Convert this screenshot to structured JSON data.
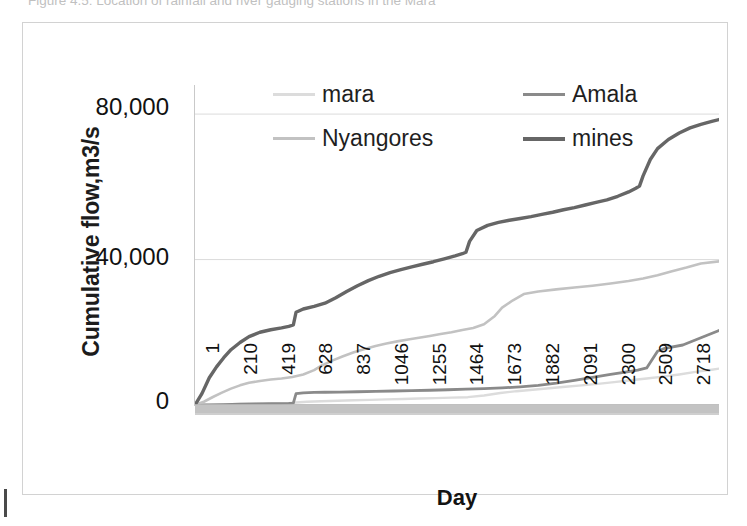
{
  "figure": {
    "caption": "Figure 4.5: Location of rainfall and river gauging stations in the Mara",
    "border_color": "#d2d2d2"
  },
  "chart_data": {
    "type": "line",
    "title": "",
    "xlabel": "Day",
    "ylabel": "Cumulative flow,m3/s",
    "xlim": [
      1,
      2900
    ],
    "ylim": [
      0,
      88000
    ],
    "ytick_labels": [
      "0",
      "40,000",
      "80,000"
    ],
    "ytick_values": [
      0,
      40000,
      80000
    ],
    "grid": "horizontal",
    "legend_position": "top-inside",
    "xtick_labels": [
      "1",
      "210",
      "419",
      "628",
      "837",
      "1046",
      "1255",
      "1464",
      "1673",
      "1882",
      "2091",
      "2300",
      "2509",
      "2718"
    ],
    "xtick_values": [
      1,
      210,
      419,
      628,
      837,
      1046,
      1255,
      1464,
      1673,
      1882,
      2091,
      2300,
      2509,
      2718
    ],
    "series": [
      {
        "name": "mara",
        "color": "#dcdcdc",
        "width": 2.4,
        "x": [
          1,
          80,
          160,
          250,
          340,
          430,
          520,
          560,
          620,
          700,
          790,
          880,
          970,
          1060,
          1150,
          1240,
          1330,
          1420,
          1510,
          1600,
          1690,
          1780,
          1870,
          1960,
          2050,
          2140,
          2230,
          2320,
          2410,
          2500,
          2590,
          2680,
          2770,
          2860,
          2900
        ],
        "y": [
          0,
          80,
          170,
          260,
          350,
          440,
          520,
          700,
          900,
          1050,
          1180,
          1300,
          1420,
          1540,
          1660,
          1780,
          1900,
          2020,
          2150,
          2600,
          3300,
          3800,
          4200,
          4600,
          5000,
          5400,
          5800,
          6300,
          6800,
          7300,
          7800,
          8400,
          9100,
          9700,
          10000
        ]
      },
      {
        "name": "Amala",
        "color": "#8a8a8a",
        "width": 2.8,
        "x": [
          1,
          80,
          160,
          250,
          340,
          430,
          520,
          545,
          560,
          600,
          660,
          720,
          800,
          900,
          1000,
          1100,
          1200,
          1300,
          1400,
          1500,
          1600,
          1700,
          1800,
          1900,
          2000,
          2100,
          2200,
          2300,
          2400,
          2450,
          2500,
          2560,
          2600,
          2700,
          2800,
          2900
        ],
        "y": [
          0,
          60,
          130,
          200,
          280,
          360,
          430,
          520,
          3100,
          3350,
          3450,
          3500,
          3560,
          3650,
          3750,
          3850,
          3950,
          4050,
          4200,
          4350,
          4500,
          4700,
          5000,
          5400,
          6000,
          6800,
          7600,
          8400,
          9200,
          9600,
          10200,
          14800,
          15600,
          16500,
          18500,
          20500
        ]
      },
      {
        "name": "Nyangores",
        "color": "#c2c2c2",
        "width": 2.6,
        "x": [
          1,
          50,
          100,
          150,
          200,
          250,
          300,
          360,
          420,
          480,
          540,
          600,
          660,
          700,
          760,
          820,
          880,
          940,
          1000,
          1060,
          1120,
          1180,
          1240,
          1300,
          1360,
          1420,
          1480,
          1540,
          1600,
          1660,
          1700,
          1760,
          1820,
          1900,
          2000,
          2100,
          2200,
          2300,
          2400,
          2480,
          2560,
          2640,
          2720,
          2800,
          2900
        ],
        "y": [
          0,
          900,
          2200,
          3400,
          4500,
          5400,
          6100,
          6600,
          7000,
          7300,
          7700,
          8400,
          9600,
          10800,
          12200,
          13400,
          14500,
          15400,
          16200,
          16900,
          17500,
          18000,
          18500,
          19000,
          19500,
          20000,
          20600,
          21200,
          22200,
          24500,
          26800,
          28800,
          30500,
          31200,
          31800,
          32300,
          32800,
          33400,
          34100,
          34800,
          35700,
          36800,
          37800,
          38900,
          39500
        ]
      },
      {
        "name": "mines",
        "color": "#666666",
        "width": 3.4,
        "x": [
          1,
          40,
          80,
          120,
          160,
          200,
          250,
          300,
          360,
          420,
          480,
          520,
          545,
          560,
          600,
          660,
          720,
          780,
          840,
          900,
          960,
          1020,
          1080,
          1140,
          1200,
          1260,
          1320,
          1380,
          1440,
          1480,
          1500,
          1520,
          1560,
          1620,
          1680,
          1740,
          1800,
          1860,
          1920,
          1980,
          2040,
          2100,
          2160,
          2220,
          2280,
          2340,
          2400,
          2440,
          2460,
          2480,
          2520,
          2560,
          2620,
          2680,
          2740,
          2800,
          2860,
          2900
        ],
        "y": [
          0,
          3200,
          7500,
          10500,
          13000,
          15200,
          17200,
          18800,
          20000,
          20700,
          21200,
          21600,
          22000,
          25500,
          26400,
          27100,
          28000,
          29500,
          31200,
          32800,
          34200,
          35400,
          36400,
          37200,
          38000,
          38700,
          39400,
          40200,
          41000,
          41600,
          42000,
          45000,
          48000,
          49400,
          50200,
          50800,
          51300,
          51800,
          52400,
          53000,
          53700,
          54300,
          55000,
          55700,
          56400,
          57400,
          58600,
          59600,
          60200,
          63000,
          67500,
          70500,
          73000,
          74800,
          76200,
          77200,
          78000,
          78500
        ]
      }
    ]
  },
  "axis": {
    "x_title": "Day",
    "y_title": "Cumulative flow,m3/s"
  },
  "legend": {
    "items": [
      {
        "label": "mara",
        "color": "#dcdcdc"
      },
      {
        "label": "Amala",
        "color": "#8a8a8a"
      },
      {
        "label": "Nyangores",
        "color": "#c2c2c2"
      },
      {
        "label": "mines",
        "color": "#666666"
      }
    ]
  }
}
